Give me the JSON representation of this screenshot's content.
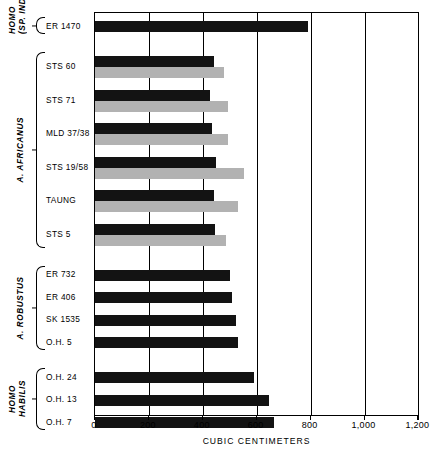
{
  "chart_data": {
    "type": "bar",
    "title": "",
    "xlabel": "CUBIC CENTIMETERS",
    "ylabel": "",
    "xlim": [
      0,
      1200
    ],
    "xticks": [
      0,
      200,
      400,
      600,
      800,
      1000,
      1200
    ],
    "xtick_labels": [
      "0",
      "200",
      "400",
      "600",
      "800",
      "1,000",
      "1,200"
    ],
    "grid": true,
    "orientation": "horizontal",
    "legend": [],
    "groups": [
      {
        "name": "HOMO\n(SP. IND.)",
        "name_lines": [
          "HOMO",
          "(SP. IND.)"
        ],
        "specimens": [
          {
            "label": "ER 1470",
            "values": [
              789
            ],
            "colors": [
              "black"
            ]
          }
        ]
      },
      {
        "name": "A. AFRICANUS",
        "name_lines": [
          "A. AFRICANUS"
        ],
        "specimens": [
          {
            "label": "STS 60",
            "values": [
              442,
              480
            ],
            "colors": [
              "black",
              "gray"
            ]
          },
          {
            "label": "STS 71",
            "values": [
              428,
              495
            ],
            "colors": [
              "black",
              "gray"
            ]
          },
          {
            "label": "MLD 37/38",
            "values": [
              435,
              492
            ],
            "colors": [
              "black",
              "gray"
            ]
          },
          {
            "label": "STS 19/58",
            "values": [
              450,
              553
            ],
            "colors": [
              "black",
              "gray"
            ]
          },
          {
            "label": "TAUNG",
            "values": [
              440,
              530
            ],
            "colors": [
              "black",
              "gray"
            ]
          },
          {
            "label": "STS 5",
            "values": [
              444,
              485
            ],
            "colors": [
              "black",
              "gray"
            ]
          }
        ]
      },
      {
        "name": "A. ROBUSTUS",
        "name_lines": [
          "A. ROBUSTUS"
        ],
        "specimens": [
          {
            "label": "ER 732",
            "values": [
              500
            ],
            "colors": [
              "black"
            ]
          },
          {
            "label": "ER 406",
            "values": [
              510
            ],
            "colors": [
              "black"
            ]
          },
          {
            "label": "SK 1535",
            "values": [
              524
            ],
            "colors": [
              "black"
            ]
          },
          {
            "label": "O.H. 5",
            "values": [
              530
            ],
            "colors": [
              "black"
            ]
          }
        ]
      },
      {
        "name": "HOMO HABILIS",
        "name_lines": [
          "HOMO",
          "HABILIS"
        ],
        "specimens": [
          {
            "label": "O.H. 24",
            "values": [
              590
            ],
            "colors": [
              "black"
            ]
          },
          {
            "label": "O.H. 13",
            "values": [
              645
            ],
            "colors": [
              "black"
            ]
          },
          {
            "label": "O.H. 7",
            "values": [
              664
            ],
            "colors": [
              "black"
            ]
          }
        ]
      }
    ],
    "colors": {
      "black": "#131313",
      "gray": "#b2b2b2",
      "axis": "#000000"
    }
  },
  "axis": {
    "title": "CUBIC CENTIMETERS",
    "tick_labels": [
      "0",
      "200",
      "400",
      "600",
      "800",
      "1,000",
      "1,200"
    ]
  },
  "caption": {
    "text": ""
  }
}
